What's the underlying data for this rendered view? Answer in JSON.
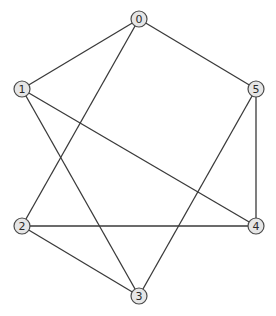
{
  "graph": {
    "type": "undirected",
    "node_radius": 8,
    "colors": {
      "background": "#ffffff",
      "edge": "#3a3a3a",
      "node_fill": "#e6e6e6",
      "node_stroke": "#4a4a4a",
      "label": "#2a2a2a"
    },
    "nodes": [
      {
        "id": "0",
        "label": "0",
        "x": 139,
        "y": 19
      },
      {
        "id": "1",
        "label": "1",
        "x": 22,
        "y": 89
      },
      {
        "id": "2",
        "label": "2",
        "x": 22,
        "y": 226
      },
      {
        "id": "3",
        "label": "3",
        "x": 139,
        "y": 296
      },
      {
        "id": "4",
        "label": "4",
        "x": 256,
        "y": 226
      },
      {
        "id": "5",
        "label": "5",
        "x": 256,
        "y": 89
      }
    ],
    "edges": [
      {
        "source": "0",
        "target": "1"
      },
      {
        "source": "0",
        "target": "5"
      },
      {
        "source": "0",
        "target": "2"
      },
      {
        "source": "1",
        "target": "4"
      },
      {
        "source": "1",
        "target": "3"
      },
      {
        "source": "5",
        "target": "4"
      },
      {
        "source": "5",
        "target": "3"
      },
      {
        "source": "2",
        "target": "4"
      },
      {
        "source": "2",
        "target": "3"
      }
    ]
  }
}
